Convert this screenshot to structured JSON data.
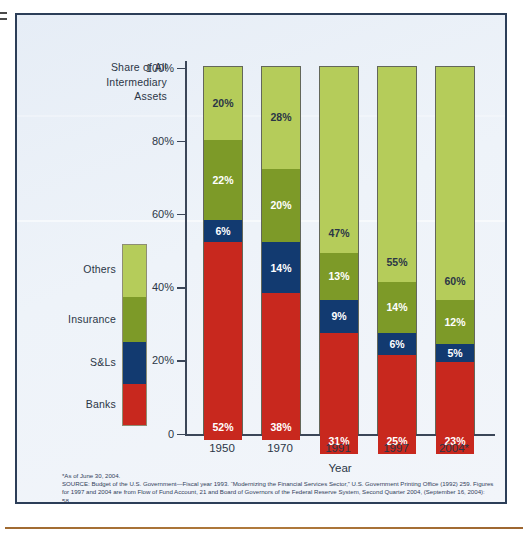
{
  "figure": {
    "block_title": "Share of All\nIntermediary\nAssets",
    "frame_color": "#2c3e58",
    "background_color": "#eaf0f6"
  },
  "legend": {
    "items": [
      {
        "label": "Others",
        "color": "#b5cc5a",
        "height_pct": 29
      },
      {
        "label": "Insurance",
        "color": "#7d9a28",
        "height_pct": 25
      },
      {
        "label": "S&Ls",
        "color": "#123a70",
        "height_pct": 23
      },
      {
        "label": "Banks",
        "color": "#c8281e",
        "height_pct": 23
      }
    ]
  },
  "axes": {
    "y_ticks": [
      "100%",
      "80%",
      "60%",
      "40%",
      "20%",
      "0"
    ],
    "y_tick_values": [
      100,
      80,
      60,
      40,
      20,
      0
    ],
    "x_labels": [
      "1950",
      "1970",
      "1991",
      "1997",
      "2004*"
    ],
    "x_axis_title": "Year"
  },
  "source": {
    "footnote": "*As of June 30, 2004.",
    "text": "SOURCE: Budget of the U.S. Government—Fiscal year 1993. “Modernizing the Financial Services Sector,” U.S. Government Printing Office (1992) 259. Figures for 1997 and 2004 are from Flow of Fund Account, 21 and Board of Governors of the Federal Reserve System, Second Quarter 2004, (September 16, 2004): 58."
  },
  "chart_data": {
    "type": "bar",
    "subtype": "stacked-bar-100",
    "xlabel": "Year",
    "ylabel": "Share of All Intermediary Assets",
    "ylim": [
      0,
      100
    ],
    "yticks": [
      0,
      20,
      40,
      60,
      80,
      100
    ],
    "ytick_labels": [
      "0",
      "20%",
      "40%",
      "60%",
      "80%",
      "100%"
    ],
    "grid": false,
    "legend_position": "left",
    "categories": [
      "1950",
      "1970",
      "1991",
      "1997",
      "2004*"
    ],
    "series": [
      {
        "name": "Banks",
        "color": "#c8281e",
        "label_color": "#ffffff",
        "values": [
          52,
          38,
          31,
          25,
          23
        ],
        "labels": [
          "52%",
          "38%",
          "31%",
          "25%",
          "23%"
        ]
      },
      {
        "name": "S&Ls",
        "color": "#123a70",
        "label_color": "#ffffff",
        "values": [
          6,
          14,
          9,
          6,
          5
        ],
        "labels": [
          "6%",
          "14%",
          "9%",
          "6%",
          "5%"
        ]
      },
      {
        "name": "Insurance",
        "color": "#7d9a28",
        "label_color": "#ffffff",
        "values": [
          22,
          20,
          13,
          14,
          12
        ],
        "labels": [
          "22%",
          "20%",
          "13%",
          "14%",
          "12%"
        ]
      },
      {
        "name": "Others",
        "color": "#b5cc5a",
        "label_color": "#2b3646",
        "values": [
          20,
          28,
          47,
          55,
          60
        ],
        "labels": [
          "20%",
          "28%",
          "47%",
          "55%",
          "60%"
        ]
      }
    ]
  }
}
